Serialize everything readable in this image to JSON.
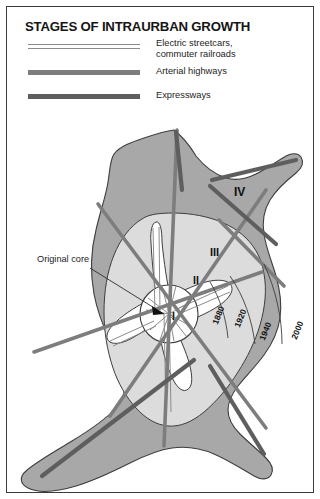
{
  "figure": {
    "title": "STAGES OF INTRAURBAN GROWTH",
    "border_color": "#3a3a3a",
    "background": "#ffffff"
  },
  "legend": {
    "items": [
      {
        "key": "electric-streetcars",
        "label": "Electric streetcars,\ncommuter railroads",
        "style": "double-line",
        "color": "#8b8b8b"
      },
      {
        "key": "arterial-highways",
        "label": "Arterial highways",
        "style": "thick-line",
        "color": "#7d7d7d"
      },
      {
        "key": "expressways",
        "label": "Expressways",
        "style": "thick-line",
        "color": "#5e5e5e"
      }
    ]
  },
  "map": {
    "callout": "Original core",
    "zones": [
      {
        "numeral": "I",
        "description": "original core, stage I"
      },
      {
        "numeral": "II",
        "description": "streetcar era, stage II"
      },
      {
        "numeral": "III",
        "description": "arterial highway era, stage III"
      },
      {
        "numeral": "IV",
        "description": "expressway era, stage IV"
      }
    ],
    "year_labels": [
      "1880",
      "1920",
      "1940",
      "2000"
    ],
    "colors": {
      "zone_outer": "#a8a8a8",
      "zone_inner": "#dcdcdc",
      "zone_core": "#ffffff",
      "outline": "#3d3d3d",
      "rail": "#8b8b8b",
      "arterial": "#7d7d7d",
      "expressway": "#5e5e5e"
    }
  }
}
